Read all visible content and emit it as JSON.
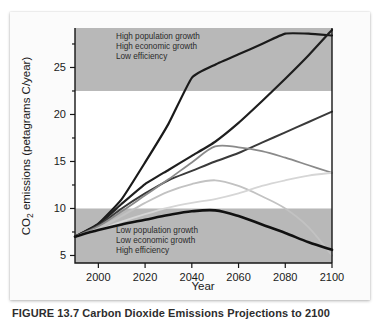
{
  "figure": {
    "caption": "FIGURE 13.7   Carbon Dioxide Emissions Projections to 2100",
    "axis_titles": {
      "x": "Year",
      "y_prefix": "CO",
      "y_sub": "2",
      "y_suffix": " emissions (petagrams C/year)"
    }
  },
  "annotations": {
    "upper": [
      "High population growth",
      "High economic growth",
      "Low efficiency"
    ],
    "lower": [
      "Low population growth",
      "Low economic growth",
      "High efficiency"
    ]
  },
  "colors": {
    "band_shade": "#b8b8b8",
    "plot_background": "#ffffff",
    "axis": "#161616",
    "series": [
      "#1a1a1a",
      "#1f1f1f",
      "#3a3a3a",
      "#4f4f4f",
      "#8a8a8a",
      "#c2c2c2",
      "#d6d6d6"
    ]
  },
  "chart_data": {
    "type": "line",
    "title": "",
    "xlabel": "Year",
    "ylabel": "CO2 emissions (petagrams C/year)",
    "xlim": [
      1990,
      2100
    ],
    "ylim": [
      4.2,
      29.2
    ],
    "xticks": [
      2000,
      2020,
      2040,
      2060,
      2080,
      2100
    ],
    "yticks": [
      5,
      10,
      15,
      20,
      25
    ],
    "grid": false,
    "legend_position": "none",
    "shaded_bands": [
      {
        "name": "high-growth-band",
        "y_from": 22.5,
        "y_to": 29.2,
        "color": "#b8b8b8"
      },
      {
        "name": "low-growth-band",
        "y_from": 4.2,
        "y_to": 10.0,
        "color": "#b8b8b8"
      }
    ],
    "x": [
      1990,
      2000,
      2010,
      2020,
      2030,
      2040,
      2050,
      2060,
      2070,
      2080,
      2090,
      2100
    ],
    "series": [
      {
        "name": "A1FI (very high emissions)",
        "color": "#1a1a1a",
        "width": 2.2,
        "values": [
          7.0,
          8.4,
          11.0,
          14.9,
          19.0,
          23.9,
          25.3,
          26.4,
          27.5,
          28.6,
          28.6,
          28.4
        ]
      },
      {
        "name": "A2 (high emissions)",
        "color": "#1f1f1f",
        "width": 2.2,
        "values": [
          7.0,
          8.3,
          10.5,
          12.6,
          14.1,
          15.6,
          17.1,
          19.1,
          21.4,
          23.8,
          26.3,
          29.0
        ]
      },
      {
        "name": "A1B (medium-high emissions)",
        "color": "#3a3a3a",
        "width": 2.0,
        "values": [
          7.0,
          8.2,
          10.0,
          11.6,
          13.0,
          14.0,
          15.0,
          15.9,
          17.0,
          18.1,
          19.2,
          20.3
        ]
      },
      {
        "name": "B2 (medium emissions)",
        "color": "#8a8a8a",
        "width": 1.8,
        "values": [
          7.0,
          8.1,
          9.7,
          11.4,
          13.1,
          14.9,
          16.6,
          16.5,
          16.1,
          15.4,
          14.6,
          13.8
        ]
      },
      {
        "name": "A1T (declining after peak)",
        "color": "#c2c2c2",
        "width": 1.8,
        "values": [
          7.0,
          7.9,
          9.2,
          10.6,
          11.8,
          12.6,
          13.0,
          12.4,
          11.3,
          10.0,
          8.0,
          5.0
        ]
      },
      {
        "name": "B1 (low emissions)",
        "color": "#d6d6d6",
        "width": 1.8,
        "values": [
          7.0,
          7.7,
          8.6,
          9.4,
          10.1,
          10.6,
          11.0,
          11.6,
          12.4,
          13.0,
          13.5,
          13.8
        ]
      },
      {
        "name": "B1 low / mitigation (lowest)",
        "color": "#111111",
        "width": 2.6,
        "values": [
          7.0,
          7.7,
          8.3,
          8.8,
          9.3,
          9.7,
          9.8,
          9.2,
          8.3,
          7.4,
          6.4,
          5.6
        ]
      }
    ]
  }
}
